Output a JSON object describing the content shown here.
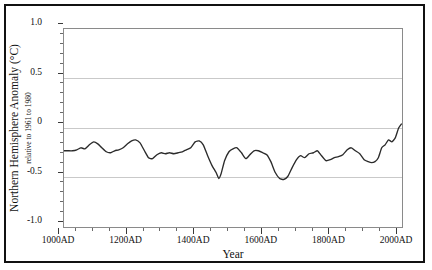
{
  "chart_data": {
    "type": "line",
    "title": "",
    "xlabel": "Year",
    "ylabel": "Northern Hemisphere Anomaly (°C)",
    "ylabel_sub": "relative to 1961 to 1980",
    "xlim": [
      1000,
      2000
    ],
    "ylim": [
      -1.0,
      1.0
    ],
    "grid": true,
    "gridlines_y": [
      0.5,
      0,
      -0.5
    ],
    "legend": "none",
    "line_color": "#2b2b2b",
    "grid_color": "#c9c9c9",
    "frame_color": "#111111",
    "xtick_labels": [
      "1000AD",
      "1200AD",
      "1400AD",
      "1600AD",
      "1800AD",
      "2000AD"
    ],
    "xtick_values": [
      1000,
      1200,
      1400,
      1600,
      1800,
      2000
    ],
    "xtick_minor_step": 50,
    "ytick_labels": [
      "1.0",
      "0.5",
      "0",
      "-0.5",
      "-1.0"
    ],
    "ytick_values": [
      1.0,
      0.5,
      0,
      -0.5,
      -1.0
    ],
    "ytick_minor_step": 0.1,
    "series": [
      {
        "name": "Northern Hemisphere temperature anomaly",
        "x": [
          1000,
          1012,
          1025,
          1038,
          1050,
          1062,
          1075,
          1088,
          1100,
          1112,
          1125,
          1138,
          1150,
          1162,
          1175,
          1188,
          1200,
          1212,
          1225,
          1238,
          1250,
          1262,
          1275,
          1288,
          1300,
          1312,
          1325,
          1338,
          1350,
          1362,
          1375,
          1388,
          1400,
          1412,
          1425,
          1438,
          1450,
          1458,
          1465,
          1475,
          1488,
          1500,
          1512,
          1525,
          1538,
          1550,
          1562,
          1575,
          1588,
          1600,
          1612,
          1625,
          1638,
          1650,
          1662,
          1675,
          1688,
          1700,
          1712,
          1725,
          1738,
          1750,
          1762,
          1775,
          1788,
          1800,
          1812,
          1825,
          1838,
          1850,
          1862,
          1875,
          1888,
          1900,
          1910,
          1920,
          1930,
          1940,
          1950,
          1960,
          1970,
          1980,
          1990,
          1998
        ],
        "y": [
          -0.23,
          -0.23,
          -0.23,
          -0.22,
          -0.2,
          -0.21,
          -0.17,
          -0.14,
          -0.16,
          -0.2,
          -0.24,
          -0.25,
          -0.23,
          -0.22,
          -0.2,
          -0.16,
          -0.13,
          -0.12,
          -0.15,
          -0.23,
          -0.3,
          -0.31,
          -0.27,
          -0.25,
          -0.26,
          -0.25,
          -0.26,
          -0.25,
          -0.24,
          -0.22,
          -0.2,
          -0.14,
          -0.13,
          -0.17,
          -0.28,
          -0.38,
          -0.45,
          -0.51,
          -0.46,
          -0.33,
          -0.24,
          -0.21,
          -0.2,
          -0.25,
          -0.31,
          -0.27,
          -0.23,
          -0.23,
          -0.25,
          -0.27,
          -0.34,
          -0.45,
          -0.51,
          -0.52,
          -0.49,
          -0.4,
          -0.32,
          -0.28,
          -0.3,
          -0.26,
          -0.25,
          -0.23,
          -0.28,
          -0.33,
          -0.32,
          -0.3,
          -0.29,
          -0.27,
          -0.22,
          -0.2,
          -0.23,
          -0.26,
          -0.32,
          -0.34,
          -0.35,
          -0.34,
          -0.3,
          -0.2,
          -0.17,
          -0.12,
          -0.14,
          -0.1,
          0.0,
          0.04
        ]
      }
    ]
  }
}
